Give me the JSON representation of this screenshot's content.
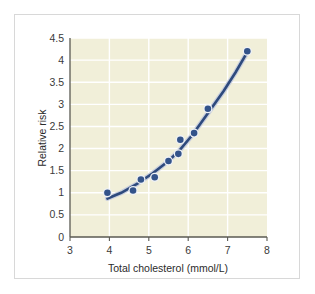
{
  "chart_data": {
    "type": "scatter",
    "title": "",
    "xlabel": "Total cholesterol (mmol/L)",
    "ylabel": "Relative risk",
    "xlim": [
      3,
      8
    ],
    "ylim": [
      0,
      4.5
    ],
    "xticks": [
      "3",
      "4",
      "5",
      "6",
      "7",
      "8"
    ],
    "yticks": [
      "0",
      "0.5",
      "1",
      "1.5",
      "2",
      "2.5",
      "3",
      "3.5",
      "4",
      "4.5"
    ],
    "grid": true,
    "legend": "none",
    "series": [
      {
        "name": "Relative risk observations",
        "marker": "circle",
        "color": "#33538a",
        "points": [
          {
            "x": 3.95,
            "y": 1.0
          },
          {
            "x": 4.6,
            "y": 1.05
          },
          {
            "x": 4.8,
            "y": 1.3
          },
          {
            "x": 5.15,
            "y": 1.35
          },
          {
            "x": 5.5,
            "y": 1.72
          },
          {
            "x": 5.75,
            "y": 1.88
          },
          {
            "x": 5.8,
            "y": 2.2
          },
          {
            "x": 6.15,
            "y": 2.35
          },
          {
            "x": 6.5,
            "y": 2.9
          },
          {
            "x": 7.5,
            "y": 4.2
          }
        ]
      },
      {
        "name": "Fitted trend curve",
        "marker": "none",
        "type": "line",
        "color": "#2e4a7d",
        "points": [
          {
            "x": 3.95,
            "y": 0.87
          },
          {
            "x": 4.3,
            "y": 1.0
          },
          {
            "x": 4.7,
            "y": 1.2
          },
          {
            "x": 5.1,
            "y": 1.44
          },
          {
            "x": 5.5,
            "y": 1.72
          },
          {
            "x": 5.8,
            "y": 1.98
          },
          {
            "x": 6.1,
            "y": 2.3
          },
          {
            "x": 6.5,
            "y": 2.8
          },
          {
            "x": 6.9,
            "y": 3.3
          },
          {
            "x": 7.2,
            "y": 3.72
          },
          {
            "x": 7.5,
            "y": 4.18
          }
        ]
      }
    ]
  },
  "colors": {
    "plot_background": "#f1efd9",
    "gridline": "#ffffff",
    "axis": "#5a5a52",
    "marker": "#33538a",
    "curve": "#2e4a7d",
    "frame_border": "#d8d8d8",
    "page_background": "#ffffff"
  }
}
